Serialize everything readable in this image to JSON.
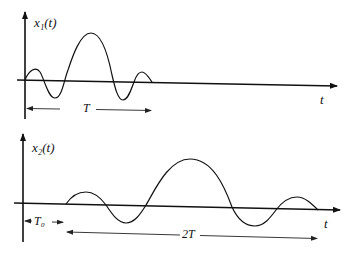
{
  "diagram": {
    "top": {
      "y_label": "x₁(t)",
      "x_label": "t",
      "duration_label": "T",
      "curve": "oscillating pulse with large central peak and smaller side lobes, starting at origin"
    },
    "bottom": {
      "y_label": "x₂(t)",
      "x_label": "t",
      "delay_label": "T₀",
      "duration_label": "2T",
      "curve": "time-scaled (stretched by 2) and delayed (by T₀) version of x₁(t)"
    },
    "colors": {
      "line": "#111111",
      "background": "#ffffff"
    }
  }
}
